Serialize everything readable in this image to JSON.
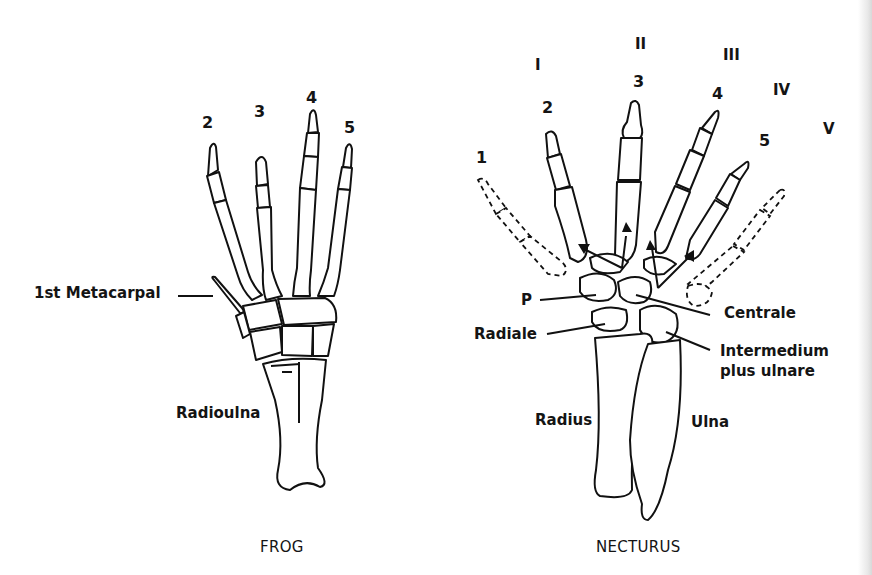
{
  "figures": {
    "frog": {
      "caption": "FROG",
      "digit_labels": [
        "2",
        "3",
        "4",
        "5"
      ],
      "callouts": {
        "first_metacarpal": "1st Metacarpal",
        "radioulna": "Radioulna"
      }
    },
    "necturus": {
      "caption": "NECTURUS",
      "digit_labels": [
        "1",
        "2",
        "3",
        "4",
        "5"
      ],
      "roman_labels": [
        "I",
        "II",
        "III",
        "IV",
        "V"
      ],
      "callouts": {
        "p": "P",
        "radiale": "Radiale",
        "centrale": "Centrale",
        "intermedium_line1": "Intermedium",
        "intermedium_line2": "plus ulnare",
        "radius": "Radius",
        "ulna": "Ulna"
      }
    }
  },
  "colors": {
    "line": "#111111",
    "background": "#ffffff"
  }
}
